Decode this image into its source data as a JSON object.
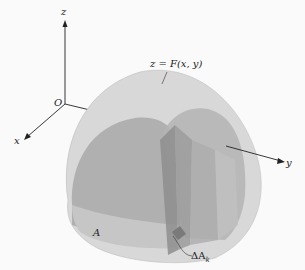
{
  "diagram": {
    "axes": {
      "z": "z",
      "x": "x",
      "y": "y",
      "origin": "O"
    },
    "labels": {
      "surface": "z = F(x, y)",
      "region": "A",
      "element": "ΔA",
      "element_sub": "k"
    },
    "colors": {
      "background": "#fafafa",
      "outer_surface": "#d6d6d6",
      "inner_surface": "#a8a8a8",
      "slab_dark": "#8f8f8f",
      "axis": "#222222"
    }
  }
}
